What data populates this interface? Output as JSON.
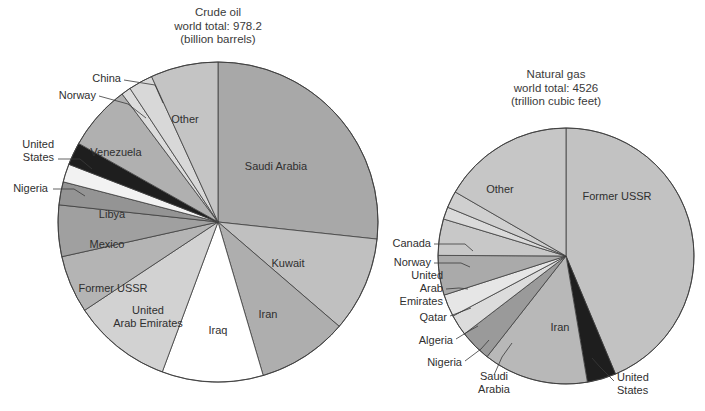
{
  "figure": {
    "background": "#ffffff",
    "stroke_color": "#3d3d3d",
    "text_color": "#2f2f2f"
  },
  "chart_data": [
    {
      "type": "pie",
      "id": "crude-oil",
      "title": "Crude oil",
      "subtitle": "world total: 978.2",
      "units": "(billion barrels)",
      "title_lines": [
        "Crude oil",
        "world total: 978.2",
        "(billion barrels)"
      ],
      "total": 978.2,
      "unit_label": "billion barrels",
      "start_angle_deg": 0,
      "direction": "clockwise",
      "center": [
        218,
        222
      ],
      "radius": 160,
      "title_pos": [
        218,
        16
      ],
      "categories": [
        "Saudi Arabia",
        "Kuwait",
        "Iran",
        "Iraq",
        "United Arab Emirates",
        "Former USSR",
        "Mexico",
        "Libya",
        "Nigeria",
        "United States",
        "Venezuela",
        "Norway",
        "China",
        "Other"
      ],
      "values": [
        261.2,
        94.0,
        89.3,
        100.0,
        98.1,
        57.0,
        50.8,
        22.8,
        17.9,
        22.5,
        64.5,
        9.4,
        24.0,
        66.7
      ],
      "percents": [
        26.7,
        9.6,
        9.1,
        10.2,
        10.0,
        5.8,
        5.2,
        2.3,
        1.8,
        2.3,
        6.6,
        1.0,
        2.5,
        6.8
      ],
      "shades": [
        "#a8a8a8",
        "#c0c0c0",
        "#aeaeae",
        "#ffffff",
        "#d2d2d2",
        "#b4b4b4",
        "#a0a0a0",
        "#949494",
        "#f2f2f2",
        "#1e1e1e",
        "#b0b0b0",
        "#dcdcdc",
        "#d8d8d8",
        "#c4c4c4"
      ],
      "labels": [
        {
          "name": "Saudi Arabia",
          "style": "inside",
          "pos": [
            276,
            167
          ]
        },
        {
          "name": "Kuwait",
          "style": "inside",
          "pos": [
            288,
            264
          ]
        },
        {
          "name": "Iran",
          "style": "inside",
          "pos": [
            268,
            315
          ]
        },
        {
          "name": "Iraq",
          "style": "inside",
          "pos": [
            218,
            331
          ]
        },
        {
          "name": "United Arab Emirates",
          "style": "inside",
          "lines": [
            "United",
            "Arab Emirates"
          ],
          "pos": [
            148,
            318
          ]
        },
        {
          "name": "Former USSR",
          "style": "inside",
          "pos": [
            113,
            289
          ]
        },
        {
          "name": "Mexico",
          "style": "inside",
          "pos": [
            107,
            245
          ]
        },
        {
          "name": "Libya",
          "style": "inside",
          "pos": [
            112,
            215
          ]
        },
        {
          "name": "Nigeria",
          "style": "callout",
          "anchor": "r",
          "pos": [
            48,
            189
          ],
          "leader": [
            [
              53,
              189
            ],
            [
              74,
              189
            ],
            [
              85,
              196
            ]
          ]
        },
        {
          "name": "United States",
          "style": "callout",
          "anchor": "r",
          "lines": [
            "United",
            "States"
          ],
          "pos": [
            54,
            152
          ],
          "leader": [
            [
              58,
              159
            ],
            [
              80,
              159
            ],
            [
              92,
              169
            ]
          ]
        },
        {
          "name": "Venezuela",
          "style": "inside",
          "pos": [
            116,
            153
          ]
        },
        {
          "name": "Norway",
          "style": "callout",
          "anchor": "r",
          "pos": [
            96,
            96
          ],
          "leader": [
            [
              99,
              96
            ],
            [
              128,
              104
            ],
            [
              146,
              118
            ]
          ]
        },
        {
          "name": "China",
          "style": "callout",
          "anchor": "r",
          "pos": [
            121,
            79
          ],
          "leader": [
            [
              124,
              80
            ],
            [
              155,
              85
            ],
            [
              163,
              103
            ]
          ]
        },
        {
          "name": "Other",
          "style": "inside",
          "pos": [
            185,
            120
          ]
        }
      ]
    },
    {
      "type": "pie",
      "id": "natural-gas",
      "title": "Natural gas",
      "subtitle": "world total: 4526",
      "units": "(trillion cubic feet)",
      "title_lines": [
        "Natural gas",
        "world total: 4526",
        "(trillion cubic feet)"
      ],
      "total": 4526,
      "unit_label": "trillion cubic feet",
      "start_angle_deg": 0,
      "direction": "clockwise",
      "center": [
        566,
        256
      ],
      "radius": 128,
      "title_pos": [
        556,
        78
      ],
      "categories": [
        "Former USSR",
        "United States",
        "Iran",
        "Saudi Arabia",
        "Nigeria",
        "Algeria",
        "Qatar",
        "United Arab Emirates",
        "Norway",
        "Canada",
        "Other"
      ],
      "values": [
        1977,
        165,
        600,
        181,
        120,
        128,
        227,
        208,
        70,
        96,
        754
      ],
      "percents": [
        43.7,
        3.6,
        13.3,
        4.0,
        2.7,
        2.8,
        5.0,
        4.6,
        1.5,
        2.1,
        16.7
      ],
      "shades": [
        "#c2c2c2",
        "#1e1e1e",
        "#b8b8b8",
        "#9a9a9a",
        "#dcdcdc",
        "#e6e6e6",
        "#aaaaaa",
        "#c8c8c8",
        "#dadada",
        "#cfcfcf",
        "#c6c6c6"
      ],
      "labels": [
        {
          "name": "Former USSR",
          "style": "inside",
          "pos": [
            617,
            197
          ]
        },
        {
          "name": "United States",
          "style": "callout",
          "anchor": "l",
          "lines": [
            "United",
            "States"
          ],
          "pos": [
            617,
            385
          ],
          "leader": [
            [
              614,
              381
            ],
            [
              600,
              367
            ],
            [
              592,
              358
            ]
          ]
        },
        {
          "name": "Iran",
          "style": "inside",
          "pos": [
            560,
            328
          ]
        },
        {
          "name": "Saudi Arabia",
          "style": "callout",
          "anchor": "c",
          "lines": [
            "Saudi",
            "Arabia"
          ],
          "pos": [
            494,
            384
          ],
          "leader": [
            [
              494,
              375
            ],
            [
              502,
              357
            ],
            [
              512,
              343
            ]
          ]
        },
        {
          "name": "Nigeria",
          "style": "callout",
          "anchor": "r",
          "pos": [
            462,
            363
          ],
          "leader": [
            [
              465,
              361
            ],
            [
              481,
              349
            ],
            [
              489,
              340
            ]
          ]
        },
        {
          "name": "Algeria",
          "style": "callout",
          "anchor": "r",
          "pos": [
            453,
            341
          ],
          "leader": [
            [
              456,
              339
            ],
            [
              469,
              331
            ],
            [
              478,
              326
            ]
          ]
        },
        {
          "name": "Qatar",
          "style": "callout",
          "anchor": "r",
          "pos": [
            447,
            318
          ],
          "leader": [
            [
              450,
              316
            ],
            [
              463,
              311
            ],
            [
              471,
              308
            ]
          ]
        },
        {
          "name": "United Arab Emirates",
          "style": "callout",
          "anchor": "r",
          "lines": [
            "United",
            "Arab",
            "Emirates"
          ],
          "pos": [
            443,
            289
          ],
          "leader": [
            [
              446,
              289
            ],
            [
              459,
              288
            ],
            [
              468,
              289
            ]
          ]
        },
        {
          "name": "Norway",
          "style": "callout",
          "anchor": "r",
          "pos": [
            431,
            263
          ],
          "leader": [
            [
              434,
              263
            ],
            [
              461,
              263
            ],
            [
              470,
              267
            ]
          ]
        },
        {
          "name": "Canada",
          "style": "callout",
          "anchor": "r",
          "pos": [
            431,
            244
          ],
          "leader": [
            [
              434,
              244
            ],
            [
              465,
              244
            ],
            [
              473,
              251
            ]
          ]
        },
        {
          "name": "Other",
          "style": "inside",
          "pos": [
            500,
            190
          ]
        }
      ]
    }
  ]
}
